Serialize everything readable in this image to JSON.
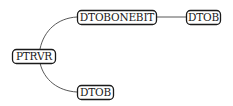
{
  "diagram": {
    "type": "tree",
    "nodes": [
      {
        "id": "root",
        "label": "PTRVR"
      },
      {
        "id": "n1",
        "label": "DTOBONEBIT"
      },
      {
        "id": "n2",
        "label": "DTOB"
      },
      {
        "id": "n3",
        "label": "DTOB"
      }
    ],
    "edges": [
      {
        "from": "root",
        "to": "n1"
      },
      {
        "from": "n1",
        "to": "n2"
      },
      {
        "from": "root",
        "to": "n3"
      }
    ],
    "colors": {
      "stroke": "#1a1a1a",
      "edge": "#444444",
      "background": "#ffffff"
    }
  }
}
